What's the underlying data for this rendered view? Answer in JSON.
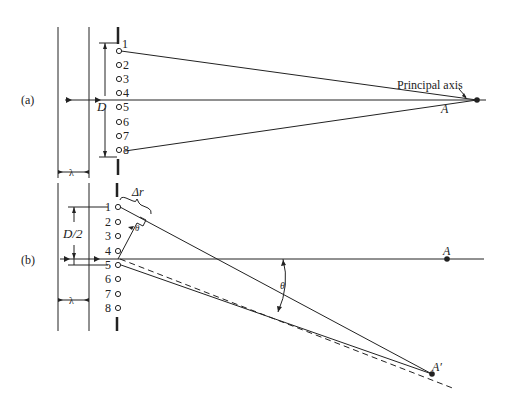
{
  "panel_a": {
    "label": "(a)",
    "wavelength_label": "λ",
    "aperture_label": "D",
    "sources": [
      "1",
      "2",
      "3",
      "4",
      "5",
      "6",
      "7",
      "8"
    ],
    "axis_label": "Principal axis",
    "point_label": "A"
  },
  "panel_b": {
    "label": "(b)",
    "wavelength_label": "λ",
    "half_aperture_label": "D/2",
    "path_diff_label": "Δr",
    "angle_label_small": "θ",
    "angle_label_large": "θ",
    "sources": [
      "1",
      "2",
      "3",
      "4",
      "5",
      "6",
      "7",
      "8"
    ],
    "point_label": "A",
    "offaxis_point_label": "A′"
  }
}
